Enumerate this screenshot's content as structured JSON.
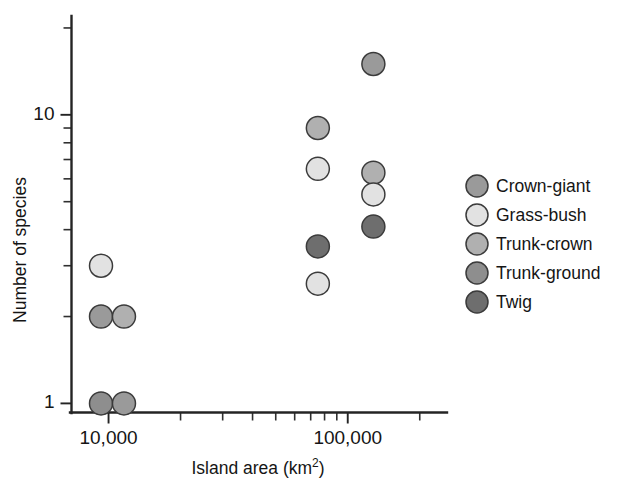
{
  "chart_data": {
    "type": "scatter",
    "title": "",
    "xlabel": "Island area (km2)",
    "xlabel_base": "Island area (km",
    "xlabel_sup": "2",
    "xlabel_tail": ")",
    "ylabel": "Number of species",
    "xscale": "log",
    "yscale": "log",
    "xlim": [
      7000,
      260000
    ],
    "ylim": [
      0.93,
      22
    ],
    "xticks": [
      {
        "value": 10000,
        "label": "10,000",
        "major": true
      },
      {
        "value": 20000,
        "label": "",
        "major": false
      },
      {
        "value": 30000,
        "label": "",
        "major": false
      },
      {
        "value": 40000,
        "label": "",
        "major": false
      },
      {
        "value": 50000,
        "label": "",
        "major": false
      },
      {
        "value": 60000,
        "label": "",
        "major": false
      },
      {
        "value": 70000,
        "label": "",
        "major": false
      },
      {
        "value": 80000,
        "label": "",
        "major": false
      },
      {
        "value": 90000,
        "label": "",
        "major": false
      },
      {
        "value": 100000,
        "label": "100,000",
        "major": true
      },
      {
        "value": 200000,
        "label": "",
        "major": false
      }
    ],
    "yticks": [
      {
        "value": 1,
        "label": "1",
        "major": true
      },
      {
        "value": 2,
        "label": "",
        "major": false
      },
      {
        "value": 3,
        "label": "",
        "major": false
      },
      {
        "value": 4,
        "label": "",
        "major": false
      },
      {
        "value": 5,
        "label": "",
        "major": false
      },
      {
        "value": 6,
        "label": "",
        "major": false
      },
      {
        "value": 7,
        "label": "",
        "major": false
      },
      {
        "value": 8,
        "label": "",
        "major": false
      },
      {
        "value": 9,
        "label": "",
        "major": false
      },
      {
        "value": 10,
        "label": "10",
        "major": true
      },
      {
        "value": 20,
        "label": "",
        "major": false
      }
    ],
    "grid": false,
    "legend_position": "right",
    "series": [
      {
        "name": "Crown-giant",
        "color": "#9a9a9a"
      },
      {
        "name": "Grass-bush",
        "color": "#e2e2e2"
      },
      {
        "name": "Trunk-crown",
        "color": "#b0b0b0"
      },
      {
        "name": "Trunk-ground",
        "color": "#8e8e8e"
      },
      {
        "name": "Twig",
        "color": "#6e6e6e"
      }
    ],
    "points": [
      {
        "series": "Grass-bush",
        "x": 9300,
        "y": 3.0
      },
      {
        "series": "Crown-giant",
        "x": 9300,
        "y": 2.0
      },
      {
        "series": "Trunk-crown",
        "x": 11600,
        "y": 2.0
      },
      {
        "series": "Trunk-ground",
        "x": 9300,
        "y": 1.0
      },
      {
        "series": "Crown-giant",
        "x": 11600,
        "y": 1.0
      },
      {
        "series": "Trunk-crown",
        "x": 75000,
        "y": 9.0
      },
      {
        "series": "Grass-bush",
        "x": 75000,
        "y": 6.5
      },
      {
        "series": "Twig",
        "x": 75000,
        "y": 3.5
      },
      {
        "series": "Grass-bush",
        "x": 75000,
        "y": 2.6
      },
      {
        "series": "Crown-giant",
        "x": 128000,
        "y": 15.0
      },
      {
        "series": "Trunk-crown",
        "x": 128000,
        "y": 6.3
      },
      {
        "series": "Grass-bush",
        "x": 128000,
        "y": 5.3
      },
      {
        "series": "Twig",
        "x": 128000,
        "y": 4.1
      }
    ]
  }
}
